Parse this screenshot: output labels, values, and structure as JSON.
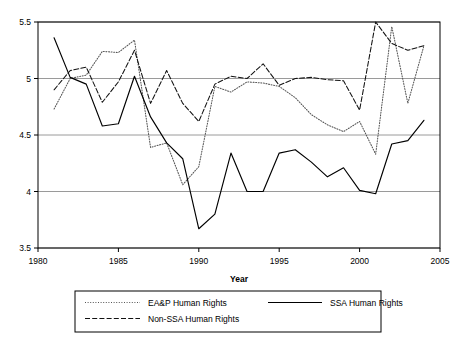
{
  "chart_data": {
    "type": "line",
    "title": "",
    "xlabel": "Year",
    "ylabel": "",
    "xlim": [
      1980,
      2005
    ],
    "ylim": [
      3.5,
      5.5
    ],
    "xticks": [
      1980,
      1985,
      1990,
      1995,
      2000,
      2005
    ],
    "yticks": [
      3.5,
      4,
      4.5,
      5,
      5.5
    ],
    "xtick_labels": [
      "1980",
      "1985",
      "1990",
      "1995",
      "2000",
      "2005"
    ],
    "ytick_labels": [
      "3.5",
      "4",
      "4.5",
      "5",
      "5.5"
    ],
    "grid": "horizontal",
    "legend_position": "below",
    "x": [
      1981,
      1982,
      1983,
      1984,
      1985,
      1986,
      1987,
      1988,
      1989,
      1990,
      1991,
      1992,
      1993,
      1994,
      1995,
      1996,
      1997,
      1998,
      1999,
      2000,
      2001,
      2002,
      2003,
      2004
    ],
    "series": [
      {
        "name": "EA&P Human Rights",
        "style": "dotted",
        "color": "#555555",
        "values": [
          4.73,
          5.0,
          5.03,
          5.24,
          5.23,
          5.34,
          4.39,
          4.43,
          4.06,
          4.22,
          4.93,
          4.88,
          4.97,
          4.96,
          4.93,
          4.83,
          4.68,
          4.59,
          4.53,
          4.62,
          4.33,
          5.46,
          4.78,
          5.29
        ]
      },
      {
        "name": "SSA Human Rights",
        "style": "solid",
        "color": "#000000",
        "values": [
          5.36,
          5.01,
          4.95,
          4.58,
          4.6,
          5.02,
          4.66,
          4.43,
          4.29,
          3.67,
          3.8,
          4.34,
          4.0,
          4.0,
          4.34,
          4.37,
          4.26,
          4.13,
          4.21,
          4.01,
          3.98,
          4.42,
          4.45,
          4.63
        ]
      },
      {
        "name": "Non-SSA Human Rights",
        "style": "dashed",
        "color": "#111111",
        "values": [
          4.9,
          5.07,
          5.1,
          4.79,
          4.97,
          5.25,
          4.78,
          5.07,
          4.78,
          4.62,
          4.95,
          5.02,
          5.0,
          5.13,
          4.94,
          5.0,
          5.01,
          4.99,
          4.98,
          4.72,
          5.5,
          5.31,
          5.25,
          5.29
        ]
      }
    ]
  },
  "legend": {
    "items": [
      {
        "label": "EA&P Human Rights",
        "style": "dotted"
      },
      {
        "label": "SSA Human Rights",
        "style": "solid"
      },
      {
        "label": "Non-SSA Human Rights",
        "style": "dashed"
      }
    ]
  },
  "axis": {
    "x_title": "Year"
  }
}
